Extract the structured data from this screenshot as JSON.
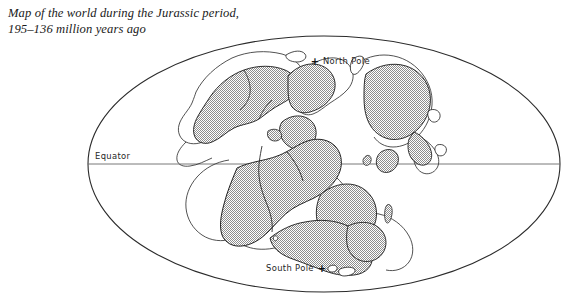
{
  "caption": {
    "line1": "Map of the world during the Jurassic period,",
    "line2": "195–136 million years ago",
    "full": "Map of the world during the Jurassic period,\n195–136 million years ago"
  },
  "map": {
    "projection": "ellipse",
    "labels": {
      "north_pole": "North Pole",
      "north_pole_marker": "+",
      "equator": "Equator",
      "south_pole": "South Pole",
      "south_pole_marker": "+"
    },
    "colors": {
      "outline": "#2b2b2b",
      "equator_line": "#5a5a5a",
      "land_fill": "#b9b9b9",
      "land_stroke": "#222222",
      "background": "#ffffff",
      "text": "#1a1a1a"
    },
    "geometry": {
      "ellipse_cx": 324,
      "ellipse_cy": 164,
      "ellipse_rx": 236,
      "ellipse_ry": 128,
      "equator_y": 164
    },
    "landmasses": [
      "laurentia-north-america",
      "greenland-block",
      "eurasia-siberia",
      "europe-iberia",
      "tethys-microplates",
      "gondwana-africa-south-america",
      "antarctica-australia",
      "india-madagascar-islands",
      "south-polar-islands"
    ]
  }
}
